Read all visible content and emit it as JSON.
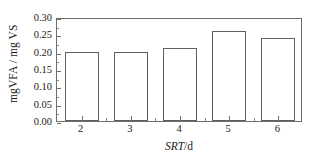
{
  "chart_data": {
    "type": "bar",
    "title": "",
    "categories": [
      "2",
      "3",
      "4",
      "5",
      "6"
    ],
    "values": [
      0.2,
      0.2,
      0.21,
      0.26,
      0.24
    ],
    "series": [
      {
        "name": "mgVFA / mg VS",
        "values": [
          0.2,
          0.2,
          0.21,
          0.26,
          0.24
        ]
      }
    ],
    "xlabel_italic": "SRT",
    "xlabel_rest": "/d",
    "xlabel": "SRT/d",
    "ylabel": "mgVFA / mg VS",
    "ylim": [
      0.0,
      0.3
    ],
    "ytick_values": [
      0.0,
      0.05,
      0.1,
      0.15,
      0.2,
      0.25,
      0.3
    ],
    "ytick_labels": [
      "0.00",
      "0.05",
      "0.10",
      "0.15",
      "0.20",
      "0.25",
      "0.30"
    ],
    "xtick_labels": [
      "2",
      "3",
      "4",
      "5",
      "6"
    ],
    "grid": false,
    "legend": false,
    "legend_position": "none",
    "bar_fill_color": "#ffffff",
    "bar_edge_color": "#5f5f5f",
    "axis_color": "#6e6e6e",
    "text_color": "#1a1a1a",
    "background_color": "#ffffff"
  }
}
